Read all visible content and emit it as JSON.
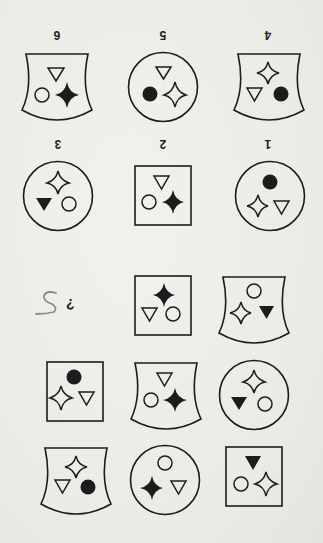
{
  "orientation": "rotated-180",
  "colors": {
    "ink": "#1c1c1c",
    "paper": "#efeeea",
    "pencil": "#8a8a8a"
  },
  "matrix": {
    "question_mark": "¿",
    "rows": [
      [
        {
          "cell": "missing",
          "content": "question-mark-with-pencil-5"
        },
        {
          "frame": "square",
          "symbols": [
            "star-filled",
            "triangle-outline",
            "circle-outline"
          ]
        },
        {
          "frame": "shield",
          "symbols": [
            "circle-outline",
            "star-outline",
            "triangle-filled"
          ]
        }
      ],
      [
        {
          "frame": "square",
          "symbols": [
            "circle-filled",
            "star-outline",
            "triangle-outline"
          ]
        },
        {
          "frame": "shield",
          "symbols": [
            "triangle-outline",
            "circle-outline",
            "star-filled"
          ]
        },
        {
          "frame": "circle",
          "symbols": [
            "star-outline",
            "triangle-filled",
            "circle-outline"
          ]
        }
      ],
      [
        {
          "frame": "shield",
          "symbols": [
            "star-outline",
            "triangle-outline",
            "circle-filled"
          ]
        },
        {
          "frame": "circle",
          "symbols": [
            "circle-outline",
            "star-filled",
            "triangle-outline"
          ]
        },
        {
          "frame": "square",
          "symbols": [
            "triangle-filled",
            "circle-outline",
            "star-outline"
          ]
        }
      ]
    ]
  },
  "pencil_mark": "5",
  "options": [
    {
      "number": "1",
      "frame": "circle",
      "symbols": [
        "circle-filled",
        "star-outline",
        "triangle-outline"
      ]
    },
    {
      "number": "2",
      "frame": "square",
      "symbols": [
        "triangle-outline",
        "circle-outline",
        "star-filled"
      ]
    },
    {
      "number": "3",
      "frame": "circle",
      "symbols": [
        "star-outline",
        "triangle-filled",
        "circle-outline"
      ]
    },
    {
      "number": "4",
      "frame": "shield",
      "symbols": [
        "star-outline",
        "triangle-outline",
        "circle-filled"
      ]
    },
    {
      "number": "5",
      "frame": "circle",
      "symbols": [
        "triangle-outline",
        "circle-filled",
        "star-outline"
      ]
    },
    {
      "number": "6",
      "frame": "shield",
      "symbols": [
        "triangle-outline",
        "circle-outline",
        "star-filled"
      ]
    }
  ]
}
